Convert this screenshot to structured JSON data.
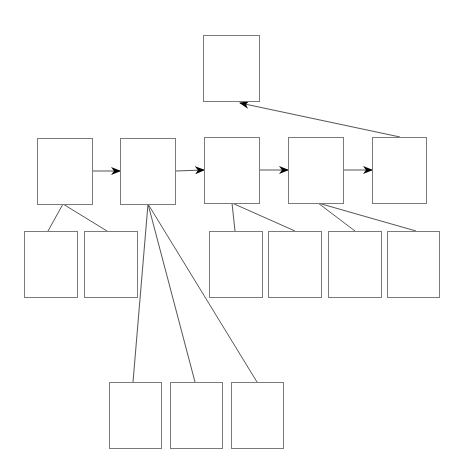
{
  "diagram": {
    "type": "tree-flow",
    "colors": {
      "box_stroke": "#7a7a7a",
      "edge": "#555555",
      "arrowhead": "#000000",
      "background": "#ffffff"
    },
    "nodes": [
      {
        "id": "top",
        "label": ""
      },
      {
        "id": "m1",
        "label": ""
      },
      {
        "id": "m2",
        "label": ""
      },
      {
        "id": "m3",
        "label": ""
      },
      {
        "id": "m4",
        "label": ""
      },
      {
        "id": "m5",
        "label": ""
      },
      {
        "id": "c1a",
        "label": ""
      },
      {
        "id": "c1b",
        "label": ""
      },
      {
        "id": "c3a",
        "label": ""
      },
      {
        "id": "c3b",
        "label": ""
      },
      {
        "id": "c4a",
        "label": ""
      },
      {
        "id": "c4b",
        "label": ""
      },
      {
        "id": "c2a",
        "label": ""
      },
      {
        "id": "c2b",
        "label": ""
      },
      {
        "id": "c2c",
        "label": ""
      }
    ],
    "arrows": [
      {
        "from": "m1",
        "to": "m2"
      },
      {
        "from": "m2",
        "to": "m3"
      },
      {
        "from": "m3",
        "to": "m4"
      },
      {
        "from": "m4",
        "to": "m5"
      },
      {
        "from": "m5",
        "to": "top"
      }
    ],
    "links": [
      {
        "from": "m1",
        "to": "c1a"
      },
      {
        "from": "m1",
        "to": "c1b"
      },
      {
        "from": "m2",
        "to": "c2a"
      },
      {
        "from": "m2",
        "to": "c2b"
      },
      {
        "from": "m2",
        "to": "c2c"
      },
      {
        "from": "m3",
        "to": "c3a"
      },
      {
        "from": "m3",
        "to": "c3b"
      },
      {
        "from": "m4",
        "to": "c4a"
      },
      {
        "from": "m4",
        "to": "c4b"
      }
    ]
  }
}
